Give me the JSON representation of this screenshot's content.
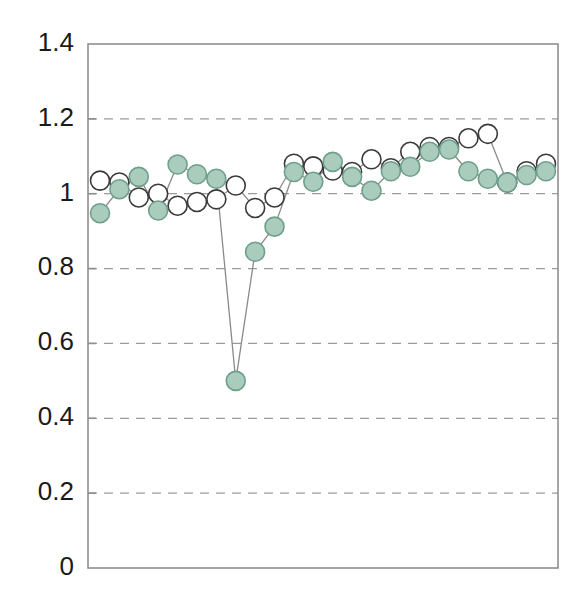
{
  "chart_data": {
    "type": "line",
    "title": "",
    "xlabel": "",
    "ylabel": "",
    "ylim": [
      0,
      1.4
    ],
    "yticks": [
      0,
      0.2,
      0.4,
      0.6,
      0.8,
      1,
      1.2,
      1.4
    ],
    "ytick_labels": [
      "0",
      "0.2",
      "0.4",
      "0.6",
      "0.8",
      "1",
      "1.2",
      "1.4"
    ],
    "xticks": [],
    "xtick_labels": [],
    "grid": "horizontal-dashed",
    "legend": "none",
    "x": [
      1,
      2,
      3,
      4,
      5,
      6,
      7,
      8,
      9,
      10,
      11,
      12,
      13,
      14,
      15,
      16,
      17,
      18,
      19,
      20,
      21,
      22,
      23,
      24
    ],
    "series": [
      {
        "name": "open-circles",
        "marker": "open-circle",
        "marker_fill": "#ffffff",
        "marker_edge": "#3a3a3a",
        "line_color": "#8a8a8a",
        "values": [
          1.035,
          1.03,
          0.99,
          1.0,
          0.968,
          0.978,
          0.985,
          1.022,
          0.962,
          0.99,
          1.08,
          1.073,
          1.062,
          1.058,
          1.092,
          1.068,
          1.112,
          1.125,
          1.125,
          1.148,
          1.16,
          1.03,
          1.06,
          1.08
        ]
      },
      {
        "name": "filled-circles",
        "marker": "filled-circle",
        "marker_fill": "#a9ccbc",
        "marker_edge": "#6f9f8c",
        "line_color": "#8a8a8a",
        "values": [
          0.948,
          1.012,
          1.045,
          0.955,
          1.078,
          1.052,
          1.04,
          0.5,
          0.845,
          0.912,
          1.058,
          1.032,
          1.085,
          1.045,
          1.008,
          1.06,
          1.072,
          1.112,
          1.118,
          1.06,
          1.04,
          1.03,
          1.05,
          1.06
        ]
      }
    ]
  },
  "axes": {
    "plot_left": 88,
    "plot_right": 558,
    "plot_top": 44,
    "plot_bottom": 568,
    "frame_color": "#8f8f8f",
    "grid_color": "#9a9a9a"
  }
}
